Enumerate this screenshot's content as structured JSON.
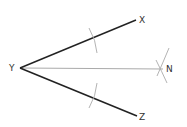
{
  "diagram": {
    "type": "angle-bisector-construction",
    "points": {
      "Y": {
        "label": "Y",
        "x": 20,
        "y": 68
      },
      "X": {
        "label": "X",
        "x": 136,
        "y": 20
      },
      "Z": {
        "label": "Z",
        "x": 137,
        "y": 116
      },
      "N": {
        "label": "N",
        "x": 163,
        "y": 69
      }
    },
    "segments": [
      {
        "from": "Y",
        "to": "X",
        "style": "bold"
      },
      {
        "from": "Y",
        "to": "Z",
        "style": "bold"
      },
      {
        "from": "Y",
        "to": "N",
        "style": "thin"
      }
    ],
    "colors": {
      "ray": "#222222",
      "bisector": "#aaaaaa",
      "arc": "#aaaaaa",
      "label": "#333333"
    }
  }
}
